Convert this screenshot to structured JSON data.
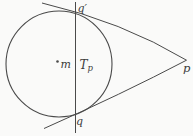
{
  "diagram": {
    "kind": "circle-tangent-polar-figure",
    "background": "#fafaf9",
    "stroke_color": "#4a4a4a",
    "label_color": "#3c3c3c",
    "labels": {
      "circle_center": "m",
      "polar_line_main": "T",
      "polar_line_sub": "p",
      "upper_tangent_point": "q′",
      "lower_tangent_point": "q",
      "external_point": "p"
    }
  }
}
